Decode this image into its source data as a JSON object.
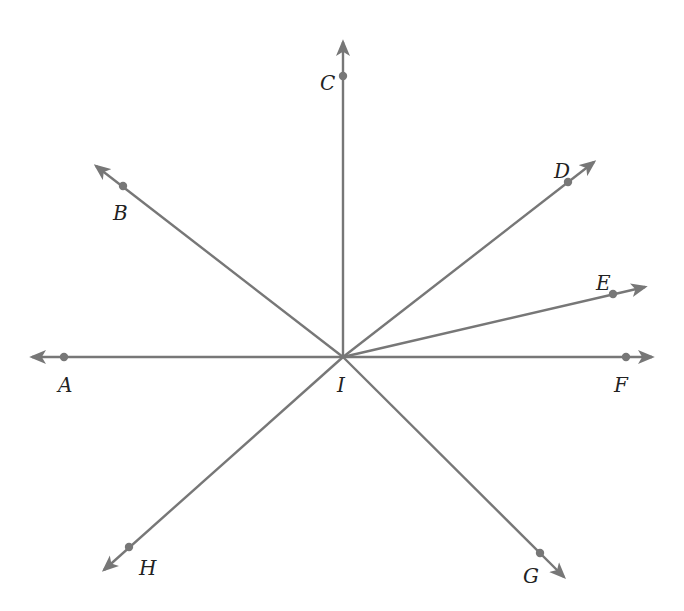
{
  "diagram": {
    "center": {
      "label": "I",
      "x": 343,
      "y": 357,
      "label_x": 337,
      "label_y": 392
    },
    "line_color": "#777777",
    "label_color": "#222222",
    "rays": [
      {
        "name": "A",
        "point": {
          "x": 64,
          "y": 357
        },
        "tip": {
          "x": 32,
          "y": 357
        },
        "label_x": 58,
        "label_y": 392
      },
      {
        "name": "B",
        "point": {
          "x": 123,
          "y": 186
        },
        "tip": {
          "x": 96,
          "y": 166
        },
        "label_x": 113,
        "label_y": 220
      },
      {
        "name": "C",
        "point": {
          "x": 343,
          "y": 76
        },
        "tip": {
          "x": 343,
          "y": 42
        },
        "label_x": 320,
        "label_y": 90
      },
      {
        "name": "D",
        "point": {
          "x": 568,
          "y": 182
        },
        "tip": {
          "x": 594,
          "y": 162
        },
        "label_x": 554,
        "label_y": 178
      },
      {
        "name": "E",
        "point": {
          "x": 613,
          "y": 294
        },
        "tip": {
          "x": 645,
          "y": 287
        },
        "label_x": 596,
        "label_y": 290
      },
      {
        "name": "F",
        "point": {
          "x": 626,
          "y": 357
        },
        "tip": {
          "x": 652,
          "y": 357
        },
        "label_x": 614,
        "label_y": 392
      },
      {
        "name": "G",
        "point": {
          "x": 540,
          "y": 553
        },
        "tip": {
          "x": 564,
          "y": 577
        },
        "label_x": 523,
        "label_y": 583
      },
      {
        "name": "H",
        "point": {
          "x": 129,
          "y": 547
        },
        "tip": {
          "x": 104,
          "y": 570
        },
        "label_x": 139,
        "label_y": 575
      }
    ]
  }
}
